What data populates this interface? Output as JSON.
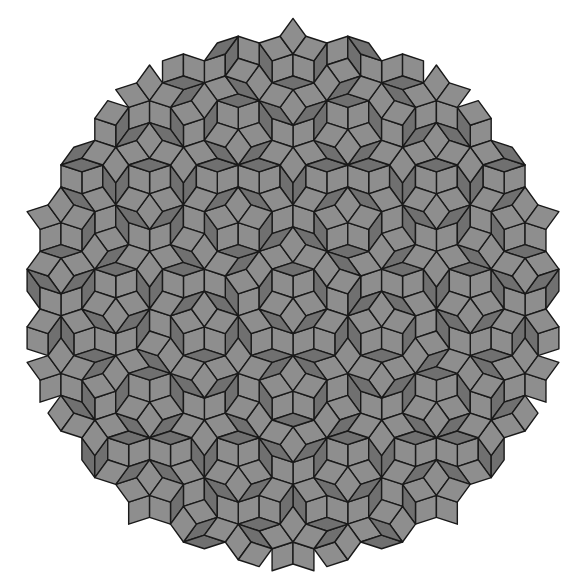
{
  "image": {
    "subject": "Penrose rhombus tiling (P3)",
    "width": 587,
    "height": 580,
    "background": "#ffffff",
    "center": [
      293,
      298
    ],
    "radius": 262,
    "edge_length": 22,
    "colors": {
      "thick_rhombus": "#8e8e8e",
      "thin_rhombus": "#707070",
      "edge": "#1a1a1a"
    },
    "symmetry": "fivefold"
  }
}
